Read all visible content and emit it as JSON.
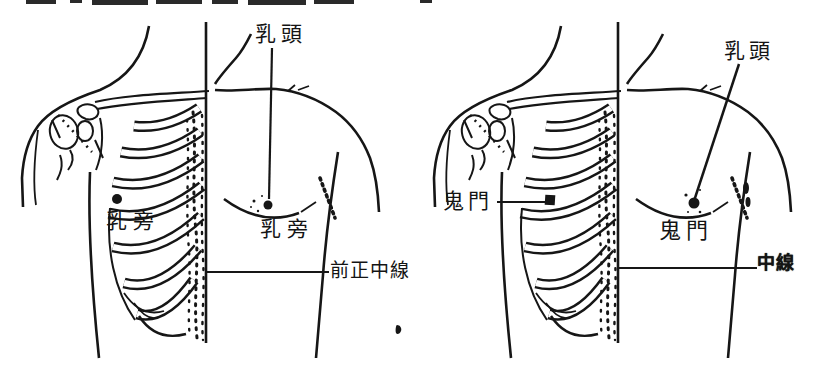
{
  "page": {
    "background": "#ffffff",
    "ink_color": "#161616"
  },
  "figure_left": {
    "labels": {
      "nipple": "乳頭",
      "point_on_skeleton": "乳旁",
      "point_on_surface": "乳旁",
      "midline": "前正中線"
    }
  },
  "figure_right": {
    "labels": {
      "point_on_skeleton": "鬼門",
      "nipple": "乳頭",
      "point_on_surface": "鬼門",
      "midline": "中線"
    }
  }
}
